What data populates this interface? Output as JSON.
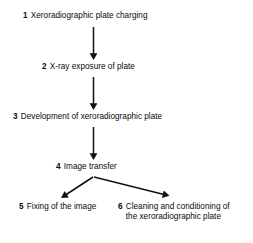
{
  "diagram": {
    "type": "flowchart",
    "orientation": "vertical-with-branch",
    "background_color": "#ffffff",
    "line_color": "#111111",
    "text_color": "#0a0a0a",
    "steps": [
      {
        "number": "1",
        "label": "Xeroradiographic plate charging"
      },
      {
        "number": "2",
        "label": "X-ray exposure of plate"
      },
      {
        "number": "3",
        "label": "Development of xeroradiographic plate"
      },
      {
        "number": "4",
        "label": "Image transfer"
      },
      {
        "number": "5",
        "label": "Fixing of the image"
      },
      {
        "number": "6",
        "label": "Cleaning and conditioning of the xeroradiographic plate"
      }
    ],
    "connectors": [
      {
        "name": "arrow-1-to-2",
        "from": "1",
        "to": "2",
        "shape": "vertical"
      },
      {
        "name": "arrow-2-to-3",
        "from": "2",
        "to": "3",
        "shape": "vertical"
      },
      {
        "name": "arrow-3-to-4",
        "from": "3",
        "to": "4",
        "shape": "vertical"
      },
      {
        "name": "arrow-4-to-5",
        "from": "4",
        "to": "5",
        "shape": "diagonal-left"
      },
      {
        "name": "arrow-4-to-6",
        "from": "4",
        "to": "6",
        "shape": "diagonal-right"
      }
    ]
  }
}
